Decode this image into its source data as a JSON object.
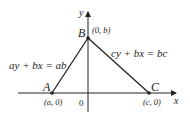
{
  "diagram": {
    "axes": {
      "x_label": "x",
      "y_label": "y",
      "origin_label": "0"
    },
    "points": {
      "A": {
        "name": "A",
        "coord": "(a, 0)"
      },
      "B": {
        "name": "B",
        "coord": "(0, b)"
      },
      "C": {
        "name": "C",
        "coord": "(c, 0)"
      }
    },
    "lines": {
      "AB": "ay + bx = ab",
      "BC": "cy + bx = bc"
    },
    "colors": {
      "stroke": "#222222",
      "background": "#ffffff"
    }
  }
}
